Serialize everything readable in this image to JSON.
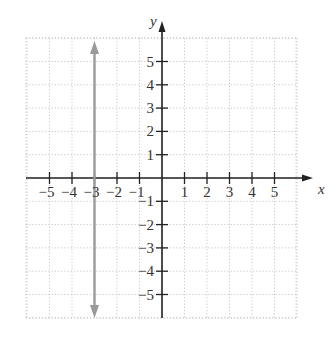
{
  "chart_data": {
    "type": "line",
    "title": "",
    "xlabel": "x",
    "ylabel": "y",
    "xlim": [
      -6,
      6
    ],
    "ylim": [
      -6,
      6
    ],
    "grid": true,
    "grid_style": "dotted",
    "x_ticks": [
      -5,
      -4,
      -3,
      -2,
      -1,
      1,
      2,
      3,
      4,
      5
    ],
    "y_ticks": [
      5,
      4,
      3,
      2,
      1,
      -1,
      -2,
      -3,
      -4,
      -5
    ],
    "x_tick_labels": [
      "−5",
      "−4",
      "−3",
      "−2",
      "−1",
      "1",
      "2",
      "3",
      "4",
      "5"
    ],
    "y_tick_labels": [
      "5",
      "4",
      "3",
      "2",
      "1",
      "−1",
      "−2",
      "−3",
      "−4",
      "−5"
    ],
    "series": [
      {
        "name": "x = -3",
        "kind": "vertical-line",
        "x": [
          -3,
          -3
        ],
        "y": [
          -6,
          6
        ],
        "arrows": "both",
        "color": "#9a9a9a"
      }
    ],
    "legend": null
  },
  "colors": {
    "axis": "#222222",
    "grid": "#c8c8c8",
    "line": "#9a9a9a",
    "text": "#333333"
  }
}
